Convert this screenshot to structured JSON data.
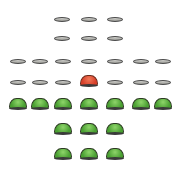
{
  "game": {
    "type": "peg-solitaire",
    "board_shape": "english-cross",
    "colors": {
      "peg": "#5cb43c",
      "selected_peg": "#e0502e",
      "empty_hole": "#b4b4b0"
    },
    "rows": [
      {
        "y": 19,
        "cells": [
          {
            "x": 62,
            "state": "empty"
          },
          {
            "x": 89,
            "state": "empty"
          },
          {
            "x": 115,
            "state": "empty"
          }
        ]
      },
      {
        "y": 38,
        "cells": [
          {
            "x": 62,
            "state": "empty"
          },
          {
            "x": 89,
            "state": "empty"
          },
          {
            "x": 115,
            "state": "empty"
          }
        ]
      },
      {
        "y": 61,
        "cells": [
          {
            "x": 18,
            "state": "empty"
          },
          {
            "x": 40,
            "state": "empty"
          },
          {
            "x": 63,
            "state": "empty"
          },
          {
            "x": 89,
            "state": "empty"
          },
          {
            "x": 115,
            "state": "empty"
          },
          {
            "x": 141,
            "state": "empty"
          },
          {
            "x": 163,
            "state": "empty"
          }
        ]
      },
      {
        "y": 82,
        "cells": [
          {
            "x": 18,
            "state": "empty"
          },
          {
            "x": 40,
            "state": "empty"
          },
          {
            "x": 63,
            "state": "empty"
          },
          {
            "x": 89,
            "state": "selected"
          },
          {
            "x": 115,
            "state": "empty"
          },
          {
            "x": 141,
            "state": "empty"
          },
          {
            "x": 163,
            "state": "empty"
          }
        ]
      },
      {
        "y": 105,
        "cells": [
          {
            "x": 18,
            "state": "peg"
          },
          {
            "x": 40,
            "state": "peg"
          },
          {
            "x": 63,
            "state": "peg"
          },
          {
            "x": 89,
            "state": "peg"
          },
          {
            "x": 115,
            "state": "peg"
          },
          {
            "x": 141,
            "state": "peg"
          },
          {
            "x": 163,
            "state": "peg"
          }
        ]
      },
      {
        "y": 130,
        "cells": [
          {
            "x": 63,
            "state": "peg"
          },
          {
            "x": 89,
            "state": "peg"
          },
          {
            "x": 115,
            "state": "peg"
          }
        ]
      },
      {
        "y": 155,
        "cells": [
          {
            "x": 63,
            "state": "peg"
          },
          {
            "x": 89,
            "state": "peg"
          },
          {
            "x": 115,
            "state": "peg"
          }
        ]
      }
    ]
  }
}
